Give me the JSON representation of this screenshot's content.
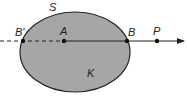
{
  "diagram": {
    "labels": {
      "surface": "S",
      "body": "K",
      "b_prime": "B'",
      "a": "A",
      "b": "B",
      "p": "P"
    },
    "colors": {
      "fill": "#a6a6a6",
      "stroke": "#222222",
      "background": "#ffffff"
    }
  }
}
